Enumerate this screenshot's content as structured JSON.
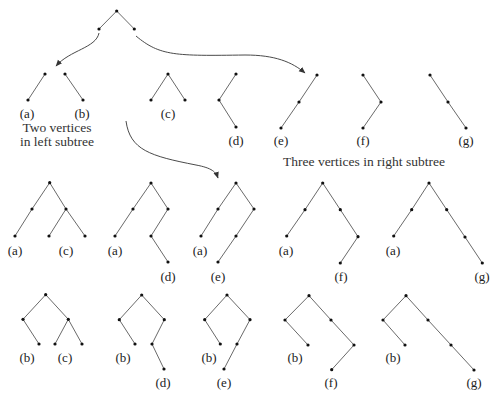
{
  "diagram": {
    "colors": {
      "edge": "#6a6a6a",
      "node": "#111111",
      "text": "#222222",
      "arrow": "#4a4a4a"
    },
    "captions": {
      "left_line1": "Two vertices",
      "left_line2": "in left subtree",
      "right": "Three vertices in right subtree"
    },
    "root_pattern": {
      "nodes": [
        [
          116.7,
          11
        ],
        [
          99,
          29
        ],
        [
          134.3,
          29
        ]
      ],
      "edges": [
        [
          0,
          1
        ],
        [
          0,
          2
        ]
      ]
    },
    "arrows": [
      {
        "name": "to-left-subtrees",
        "path": "M99,33 C96,48 70,50 56,66"
      },
      {
        "name": "to-right-subtrees",
        "path": "M136,36 C160,56 175,56 245,55 C275,55 292,62 305,73"
      },
      {
        "name": "to-combined-trees",
        "path": "M126,121 C130,150 150,156 196,165 C212,168 216,172 218,178"
      }
    ],
    "left_subtrees": [
      {
        "label": "(a)",
        "label_pos": [
          27,
          118
        ],
        "nodes": [
          [
            45,
            74
          ],
          [
            28,
            100
          ]
        ],
        "edges": [
          [
            0,
            1
          ]
        ]
      },
      {
        "label": "(b)",
        "label_pos": [
          82,
          118
        ],
        "nodes": [
          [
            65,
            74
          ],
          [
            83,
            100
          ]
        ],
        "edges": [
          [
            0,
            1
          ]
        ]
      }
    ],
    "right_subtrees": [
      {
        "label": "(c)",
        "label_pos": [
          168,
          118
        ],
        "nodes": [
          [
            168,
            74
          ],
          [
            151,
            100
          ],
          [
            185,
            100
          ]
        ],
        "edges": [
          [
            0,
            1
          ],
          [
            0,
            2
          ]
        ]
      },
      {
        "label": "(d)",
        "label_pos": [
          236,
          145
        ],
        "nodes": [
          [
            236,
            74
          ],
          [
            219,
            100
          ],
          [
            236,
            127
          ]
        ],
        "edges": [
          [
            0,
            1
          ],
          [
            1,
            2
          ]
        ]
      },
      {
        "label": "(e)",
        "label_pos": [
          281,
          145
        ],
        "nodes": [
          [
            317,
            75
          ],
          [
            299,
            102
          ],
          [
            281,
            128
          ]
        ],
        "edges": [
          [
            0,
            1
          ],
          [
            1,
            2
          ]
        ]
      },
      {
        "label": "(f)",
        "label_pos": [
          363,
          145
        ],
        "nodes": [
          [
            363,
            75
          ],
          [
            381,
            102
          ],
          [
            363,
            128
          ]
        ],
        "edges": [
          [
            0,
            1
          ],
          [
            1,
            2
          ]
        ]
      },
      {
        "label": "(g)",
        "label_pos": [
          466,
          145
        ],
        "nodes": [
          [
            430,
            75
          ],
          [
            448,
            102
          ],
          [
            466,
            128
          ]
        ],
        "edges": [
          [
            0,
            1
          ],
          [
            1,
            2
          ]
        ]
      }
    ],
    "combined_row_a": [
      {
        "labels": [
          {
            "text": "(a)",
            "pos": [
              15,
              255
            ]
          },
          {
            "text": "(c)",
            "pos": [
              66,
              255
            ]
          }
        ],
        "nodes": [
          [
            49.7,
            182.7
          ],
          [
            32,
            209
          ],
          [
            66,
            209
          ],
          [
            15,
            236
          ],
          [
            49,
            236
          ],
          [
            85,
            236
          ]
        ],
        "edges": [
          [
            0,
            1
          ],
          [
            0,
            2
          ],
          [
            1,
            3
          ],
          [
            2,
            4
          ],
          [
            2,
            5
          ]
        ]
      },
      {
        "labels": [
          {
            "text": "(a)",
            "pos": [
              115,
              255
            ]
          },
          {
            "text": "(d)",
            "pos": [
              168,
              281
            ]
          }
        ],
        "nodes": [
          [
            151,
            183
          ],
          [
            133,
            209
          ],
          [
            168,
            209
          ],
          [
            115,
            236
          ],
          [
            151,
            236
          ],
          [
            168,
            262
          ]
        ],
        "edges": [
          [
            0,
            1
          ],
          [
            0,
            2
          ],
          [
            1,
            3
          ],
          [
            2,
            4
          ],
          [
            4,
            5
          ]
        ]
      },
      {
        "labels": [
          {
            "text": "(a)",
            "pos": [
              200,
              255
            ]
          },
          {
            "text": "(e)",
            "pos": [
              218,
              281
            ]
          }
        ],
        "nodes": [
          [
            236,
            183
          ],
          [
            218,
            209
          ],
          [
            254,
            209
          ],
          [
            201,
            236
          ],
          [
            236,
            236
          ],
          [
            218,
            262
          ]
        ],
        "edges": [
          [
            0,
            1
          ],
          [
            0,
            2
          ],
          [
            1,
            3
          ],
          [
            2,
            4
          ],
          [
            4,
            5
          ]
        ]
      },
      {
        "labels": [
          {
            "text": "(a)",
            "pos": [
              286,
              255
            ]
          },
          {
            "text": "(f)",
            "pos": [
              341,
              281
            ]
          }
        ],
        "nodes": [
          [
            322.7,
            183
          ],
          [
            305,
            209.7
          ],
          [
            340.3,
            209.7
          ],
          [
            286.7,
            236
          ],
          [
            358,
            236.7
          ],
          [
            340.3,
            263
          ]
        ],
        "edges": [
          [
            0,
            1
          ],
          [
            0,
            2
          ],
          [
            1,
            3
          ],
          [
            2,
            4
          ],
          [
            4,
            5
          ]
        ]
      },
      {
        "labels": [
          {
            "text": "(a)",
            "pos": [
              393,
              255
            ]
          },
          {
            "text": "(g)",
            "pos": [
              482,
              281
            ]
          }
        ],
        "nodes": [
          [
            429,
            183
          ],
          [
            411.7,
            209.7
          ],
          [
            446.7,
            209.7
          ],
          [
            393.7,
            236
          ],
          [
            465,
            237
          ],
          [
            482.3,
            263
          ]
        ],
        "edges": [
          [
            0,
            1
          ],
          [
            0,
            2
          ],
          [
            1,
            3
          ],
          [
            2,
            4
          ],
          [
            4,
            5
          ]
        ]
      }
    ],
    "combined_row_b": [
      {
        "labels": [
          {
            "text": "(b)",
            "pos": [
              27,
              362
            ]
          },
          {
            "text": "(c)",
            "pos": [
              65,
              362
            ]
          }
        ],
        "nodes": [
          [
            45.7,
            294.7
          ],
          [
            23,
            319.3
          ],
          [
            68.3,
            319.3
          ],
          [
            39,
            344
          ],
          [
            55,
            344
          ],
          [
            82,
            344
          ]
        ],
        "edges": [
          [
            0,
            1
          ],
          [
            0,
            2
          ],
          [
            1,
            3
          ],
          [
            2,
            4
          ],
          [
            2,
            5
          ]
        ]
      },
      {
        "labels": [
          {
            "text": "(b)",
            "pos": [
              123,
              362
            ]
          },
          {
            "text": "(d)",
            "pos": [
              163,
              387
            ]
          }
        ],
        "nodes": [
          [
            141.7,
            295
          ],
          [
            119.3,
            319.7
          ],
          [
            164.3,
            319.7
          ],
          [
            135,
            344
          ],
          [
            152,
            344
          ],
          [
            164,
            369
          ]
        ],
        "edges": [
          [
            0,
            1
          ],
          [
            0,
            2
          ],
          [
            1,
            3
          ],
          [
            2,
            4
          ],
          [
            4,
            5
          ]
        ]
      },
      {
        "labels": [
          {
            "text": "(b)",
            "pos": [
              209,
              362
            ]
          },
          {
            "text": "(e)",
            "pos": [
              224,
              387
            ]
          }
        ],
        "nodes": [
          [
            227,
            295
          ],
          [
            204.7,
            319.7
          ],
          [
            250,
            319.7
          ],
          [
            220.3,
            344
          ],
          [
            237,
            344
          ],
          [
            224,
            369
          ]
        ],
        "edges": [
          [
            0,
            1
          ],
          [
            0,
            2
          ],
          [
            1,
            3
          ],
          [
            2,
            4
          ],
          [
            4,
            5
          ]
        ]
      },
      {
        "labels": [
          {
            "text": "(b)",
            "pos": [
              295,
              362
            ]
          },
          {
            "text": "(f)",
            "pos": [
              331,
              387
            ]
          }
        ],
        "nodes": [
          [
            309,
            295.7
          ],
          [
            285,
            320
          ],
          [
            331,
            320
          ],
          [
            308,
            345
          ],
          [
            354,
            345
          ],
          [
            331.7,
            369.7
          ]
        ],
        "edges": [
          [
            0,
            1
          ],
          [
            0,
            2
          ],
          [
            1,
            3
          ],
          [
            2,
            4
          ],
          [
            4,
            5
          ]
        ]
      },
      {
        "labels": [
          {
            "text": "(b)",
            "pos": [
              393,
              362
            ]
          },
          {
            "text": "(g)",
            "pos": [
              474,
              387
            ]
          }
        ],
        "nodes": [
          [
            406,
            295.7
          ],
          [
            383,
            320
          ],
          [
            428,
            320
          ],
          [
            405,
            345
          ],
          [
            451,
            345
          ],
          [
            474,
            370
          ]
        ],
        "edges": [
          [
            0,
            1
          ],
          [
            0,
            2
          ],
          [
            1,
            3
          ],
          [
            2,
            4
          ],
          [
            4,
            5
          ]
        ]
      }
    ]
  }
}
